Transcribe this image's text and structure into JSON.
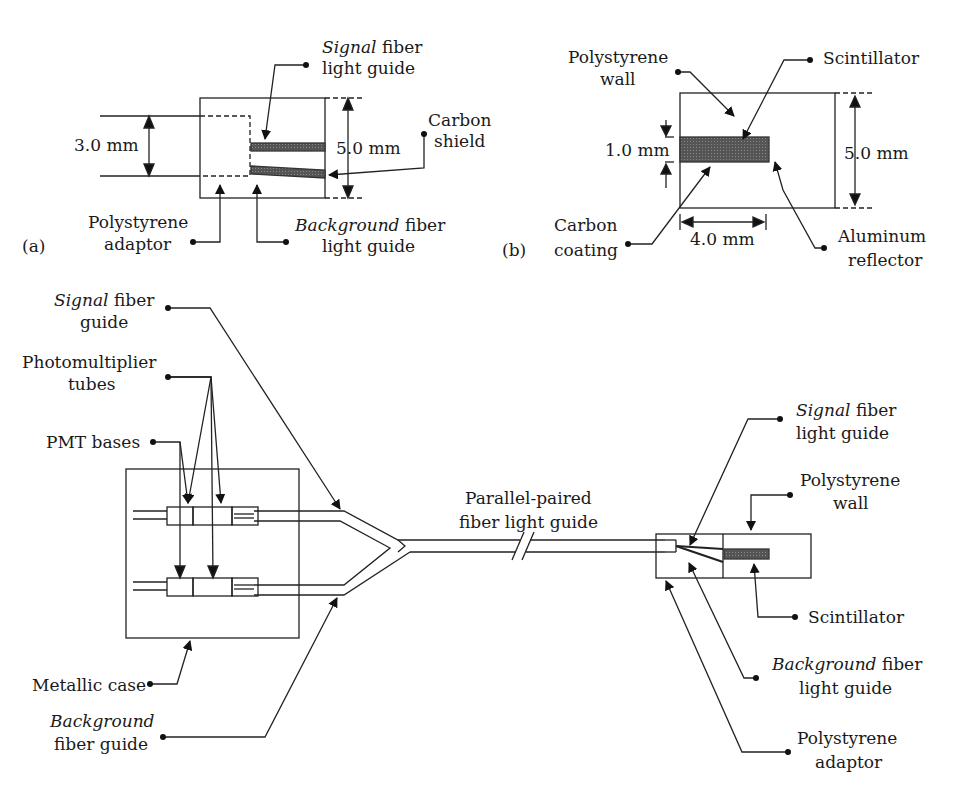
{
  "panel_a": {
    "tag": "(a)",
    "dim_left": "3.0 mm",
    "dim_right": "5.0 mm",
    "signal_label": {
      "it": "Signal",
      "rest": " fiber",
      "line2": "light guide"
    },
    "carbon_shield": {
      "line1": "Carbon",
      "line2": "shield"
    },
    "adaptor": {
      "line1": "Polystyrene",
      "line2": "adaptor"
    },
    "background_label": {
      "it": "Background",
      "rest": " fiber",
      "line2": "light guide"
    }
  },
  "panel_b": {
    "tag": "(b)",
    "wall": {
      "line1": "Polystyrene",
      "line2": "wall"
    },
    "scintillator": "Scintillator",
    "dim_thick": "1.0 mm",
    "dim_height": "5.0 mm",
    "dim_len": "4.0 mm",
    "carbon": {
      "line1": "Carbon",
      "line2": "coating"
    },
    "reflector": {
      "line1": "Aluminum",
      "line2": "reflector"
    }
  },
  "panel_c": {
    "signal_guide": {
      "it": "Signal",
      "rest": " fiber",
      "line2": "guide"
    },
    "pmt": {
      "line1": "Photomultiplier",
      "line2": "tubes"
    },
    "bases": "PMT bases",
    "case": "Metallic case",
    "background_guide": {
      "it": "Background",
      "line2": "fiber guide"
    },
    "parallel": {
      "line1": "Parallel-paired",
      "line2": "fiber light guide"
    },
    "probe_signal": {
      "it": "Signal",
      "rest": " fiber",
      "line2": "light guide"
    },
    "probe_wall": {
      "line1": "Polystyrene",
      "line2": "wall"
    },
    "probe_scint": "Scintillator",
    "probe_background": {
      "it": "Background",
      "rest": " fiber",
      "line2": "light guide"
    },
    "probe_adaptor": {
      "line1": "Polystyrene",
      "line2": "adaptor"
    }
  }
}
